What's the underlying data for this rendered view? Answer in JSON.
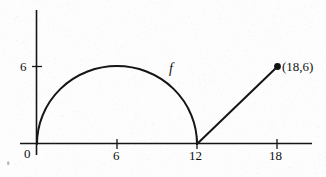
{
  "figure": {
    "background_color": "#fdfdfd",
    "ink_color": "#101010",
    "width": 326,
    "height": 177
  },
  "labels": {
    "y_tick_6": "6",
    "x_tick_0": "0",
    "x_tick_6": "6",
    "x_tick_12": "12",
    "x_tick_18": "18",
    "curve_name": "f",
    "endpoint_label": "(18,6)"
  },
  "chart_data": {
    "type": "line",
    "title": "",
    "xlabel": "",
    "ylabel": "",
    "xlim": [
      -1.3,
      20.8
    ],
    "ylim": [
      -0.9,
      10.1
    ],
    "grid": false,
    "legend": "none",
    "x_ticks": [
      0,
      6,
      12,
      18
    ],
    "x_tick_labels": [
      "0",
      "6",
      "12",
      "18"
    ],
    "y_ticks": [
      6
    ],
    "y_tick_labels": [
      "6"
    ],
    "annotations": [
      {
        "text": "f",
        "x": 10.2,
        "y": 5.6,
        "style": "italic"
      },
      {
        "text": "(18,6)",
        "x": 18.5,
        "y": 6.0,
        "style": "roman"
      }
    ],
    "markers": [
      {
        "x": 18,
        "y": 6,
        "filled": true,
        "label": "(18,6)"
      }
    ],
    "series": [
      {
        "name": "f semicircle",
        "shape": "semicircle",
        "center": [
          6,
          0
        ],
        "radius": 6,
        "x_range": [
          0,
          12
        ],
        "note": "upper half circle from (0,0) to (12,0) peaking at (6,6)",
        "x": [
          0,
          1,
          2,
          3,
          4,
          5,
          6,
          7,
          8,
          9,
          10,
          11,
          12
        ],
        "values": [
          0,
          3.32,
          4.47,
          5.2,
          5.66,
          5.92,
          6,
          5.92,
          5.66,
          5.2,
          4.47,
          3.32,
          0
        ]
      },
      {
        "name": "f line segment",
        "shape": "line",
        "x": [
          12,
          18
        ],
        "values": [
          0,
          6
        ],
        "note": "straight segment from (12,0) to (18,6), slope 1"
      }
    ]
  }
}
